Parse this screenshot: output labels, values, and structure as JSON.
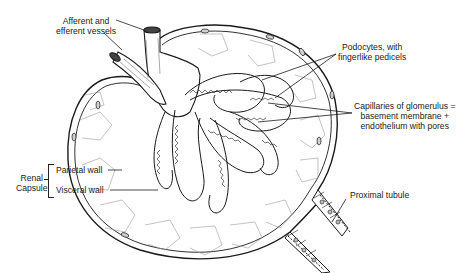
{
  "diagram": {
    "labels": {
      "vessels_line1": "Afferent and",
      "vessels_line2": "efferent vessels",
      "podocytes_line1": "Podocytes, with",
      "podocytes_line2": "fingerlike pedicels",
      "capillaries_line1": "Capillaries of glomerulus =",
      "capillaries_line2": "basement membrane +",
      "capillaries_line3": "endothelium with pores",
      "renal_line1": "Renal",
      "renal_line2": "Capsule",
      "parietal": "Parietal wall",
      "visceral": "Visceral wall",
      "proximal": "Proximal tubule"
    },
    "colors": {
      "ink": "#1a1a1a",
      "background": "#ffffff",
      "cell_lines": "#9a9a9a"
    }
  }
}
